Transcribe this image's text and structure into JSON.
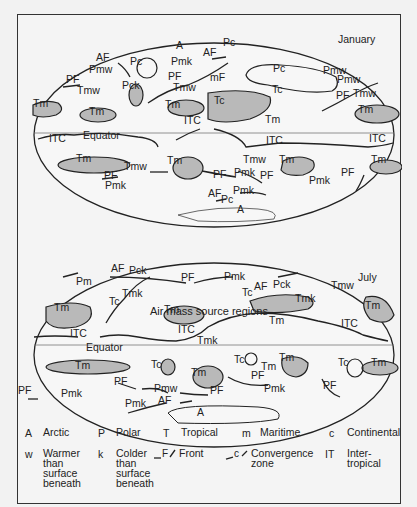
{
  "figure": {
    "caption": "Air mass source regions",
    "maps": [
      {
        "season": "January",
        "labels": [
          {
            "text": "AF",
            "x": 95,
            "y": 50
          },
          {
            "text": "Pmw",
            "x": 88,
            "y": 62
          },
          {
            "text": "Pc",
            "x": 129,
            "y": 54
          },
          {
            "text": "A",
            "x": 175,
            "y": 38
          },
          {
            "text": "Pmk",
            "x": 170,
            "y": 54
          },
          {
            "text": "AF",
            "x": 202,
            "y": 45
          },
          {
            "text": "Pc",
            "x": 222,
            "y": 35
          },
          {
            "text": "PF",
            "x": 65,
            "y": 72
          },
          {
            "text": "Tmw",
            "x": 76,
            "y": 83
          },
          {
            "text": "Pck",
            "x": 121,
            "y": 78
          },
          {
            "text": "mF",
            "x": 209,
            "y": 70
          },
          {
            "text": "PF",
            "x": 167,
            "y": 69
          },
          {
            "text": "Tmw",
            "x": 172,
            "y": 80
          },
          {
            "text": "Pc",
            "x": 272,
            "y": 61
          },
          {
            "text": "Tc",
            "x": 271,
            "y": 82
          },
          {
            "text": "Pmw",
            "x": 322,
            "y": 63
          },
          {
            "text": "Pmw",
            "x": 336,
            "y": 72
          },
          {
            "text": "PF",
            "x": 335,
            "y": 88
          },
          {
            "text": "Tmw",
            "x": 352,
            "y": 86
          },
          {
            "text": "Tm",
            "x": 32,
            "y": 96
          },
          {
            "text": "Tm",
            "x": 88,
            "y": 104
          },
          {
            "text": "Tm",
            "x": 164,
            "y": 97
          },
          {
            "text": "Tc",
            "x": 213,
            "y": 93
          },
          {
            "text": "Tm",
            "x": 357,
            "y": 102
          },
          {
            "text": "Tm",
            "x": 264,
            "y": 112
          },
          {
            "text": "ITC",
            "x": 183,
            "y": 113
          },
          {
            "text": "Equator",
            "x": 82,
            "y": 128
          },
          {
            "text": "ITC",
            "x": 48,
            "y": 131
          },
          {
            "text": "ITC",
            "x": 265,
            "y": 133
          },
          {
            "text": "ITC",
            "x": 368,
            "y": 131
          },
          {
            "text": "Tm",
            "x": 75,
            "y": 151
          },
          {
            "text": "Tmw",
            "x": 123,
            "y": 159
          },
          {
            "text": "Tm",
            "x": 166,
            "y": 153
          },
          {
            "text": "Tmw",
            "x": 242,
            "y": 152
          },
          {
            "text": "Tm",
            "x": 278,
            "y": 152
          },
          {
            "text": "Tm",
            "x": 370,
            "y": 152
          },
          {
            "text": "PF",
            "x": 103,
            "y": 168
          },
          {
            "text": "Pmk",
            "x": 104,
            "y": 178
          },
          {
            "text": "PF",
            "x": 212,
            "y": 167
          },
          {
            "text": "Pmk",
            "x": 233,
            "y": 165
          },
          {
            "text": "PF",
            "x": 259,
            "y": 168
          },
          {
            "text": "Pmk",
            "x": 308,
            "y": 173
          },
          {
            "text": "PF",
            "x": 340,
            "y": 165
          },
          {
            "text": "AF",
            "x": 207,
            "y": 186
          },
          {
            "text": "Pmk",
            "x": 232,
            "y": 183
          },
          {
            "text": "Pc",
            "x": 220,
            "y": 192
          },
          {
            "text": "A",
            "x": 236,
            "y": 202
          }
        ]
      },
      {
        "season": "July",
        "labels": [
          {
            "text": "Pmk",
            "x": 223,
            "y": 269
          },
          {
            "text": "AF",
            "x": 110,
            "y": 261
          },
          {
            "text": "Pck",
            "x": 128,
            "y": 263
          },
          {
            "text": "Pm",
            "x": 75,
            "y": 274
          },
          {
            "text": "PF",
            "x": 180,
            "y": 270
          },
          {
            "text": "AF",
            "x": 253,
            "y": 279
          },
          {
            "text": "Pck",
            "x": 272,
            "y": 277
          },
          {
            "text": "Tmw",
            "x": 330,
            "y": 278
          },
          {
            "text": "Tmk",
            "x": 121,
            "y": 286
          },
          {
            "text": "Tmk",
            "x": 294,
            "y": 291
          },
          {
            "text": "Tc",
            "x": 108,
            "y": 294
          },
          {
            "text": "Tc",
            "x": 241,
            "y": 285
          },
          {
            "text": "Tm",
            "x": 53,
            "y": 300
          },
          {
            "text": "Tm",
            "x": 163,
            "y": 302
          },
          {
            "text": "Tm",
            "x": 364,
            "y": 298
          },
          {
            "text": "Tm",
            "x": 268,
            "y": 313
          },
          {
            "text": "ITC",
            "x": 69,
            "y": 326
          },
          {
            "text": "ITC",
            "x": 177,
            "y": 322
          },
          {
            "text": "ITC",
            "x": 340,
            "y": 316
          },
          {
            "text": "Tmk",
            "x": 196,
            "y": 333
          },
          {
            "text": "Equator",
            "x": 85,
            "y": 340
          },
          {
            "text": "Tm",
            "x": 74,
            "y": 358
          },
          {
            "text": "Tc",
            "x": 150,
            "y": 357
          },
          {
            "text": "Tc",
            "x": 233,
            "y": 352
          },
          {
            "text": "Tm",
            "x": 190,
            "y": 365
          },
          {
            "text": "Tm",
            "x": 278,
            "y": 350
          },
          {
            "text": "Tm",
            "x": 260,
            "y": 359
          },
          {
            "text": "Tc",
            "x": 337,
            "y": 355
          },
          {
            "text": "Tm",
            "x": 370,
            "y": 355
          },
          {
            "text": "PF",
            "x": 113,
            "y": 374
          },
          {
            "text": "PF",
            "x": 250,
            "y": 368
          },
          {
            "text": "Pmw",
            "x": 153,
            "y": 381
          },
          {
            "text": "Pmk",
            "x": 263,
            "y": 381
          },
          {
            "text": "PF",
            "x": 322,
            "y": 378
          },
          {
            "text": "Pmk",
            "x": 124,
            "y": 396
          },
          {
            "text": "AF",
            "x": 157,
            "y": 393
          },
          {
            "text": "PF",
            "x": 209,
            "y": 383
          },
          {
            "text": "Pmk",
            "x": 60,
            "y": 386
          },
          {
            "text": "PF",
            "x": 17,
            "y": 383
          },
          {
            "text": "A",
            "x": 196,
            "y": 405
          }
        ]
      }
    ]
  },
  "legend": [
    {
      "key": "A",
      "text": [
        "Arctic"
      ]
    },
    {
      "key": "P",
      "text": [
        "Polar"
      ]
    },
    {
      "key": "T",
      "text": [
        "Tropical"
      ]
    },
    {
      "key": "m",
      "text": [
        "Maritime"
      ]
    },
    {
      "key": "c",
      "text": [
        "Continental"
      ]
    },
    {
      "key": "w",
      "text": [
        "Warmer",
        "than",
        "surface",
        "beneath"
      ]
    },
    {
      "key": "k",
      "text": [
        "Colder",
        "than",
        "surface",
        "beneath"
      ]
    },
    {
      "key": "F",
      "text": [
        "Front"
      ]
    },
    {
      "key": "c",
      "text": [
        "Convergence",
        "zone"
      ]
    },
    {
      "key": "IT",
      "text": [
        "Inter-",
        "tropical"
      ]
    }
  ]
}
